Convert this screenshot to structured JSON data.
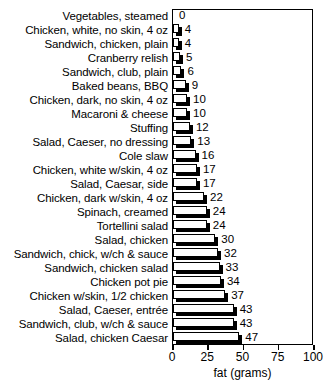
{
  "chart_data": {
    "type": "bar",
    "orientation": "horizontal",
    "title": "",
    "xlabel": "fat (grams)",
    "ylabel": "",
    "xlim": [
      0,
      100
    ],
    "xticks": [
      0,
      25,
      50,
      75,
      100
    ],
    "grid": false,
    "legend": null,
    "value_labels": true,
    "categories": [
      "Vegetables, steamed",
      "Chicken, white, no skin, 4 oz",
      "Sandwich, chicken, plain",
      "Cranberry relish",
      "Sandwich, club, plain",
      "Baked beans, BBQ",
      "Chicken, dark, no skin, 4 oz",
      "Macaroni & cheese",
      "Stuffing",
      "Salad, Caeser, no dressing",
      "Cole slaw",
      "Chicken, white w/skin, 4 oz",
      "Salad, Caesar, side",
      "Chicken, dark w/skin, 4 oz",
      "Spinach, creamed",
      "Tortellini salad",
      "Salad, chicken",
      "Sandwich, chick, w/ch & sauce",
      "Sandwich, chicken salad",
      "Chicken pot pie",
      "Chicken w/skin, 1/2 chicken",
      "Salad, Caeser, entrée",
      "Sandwich, club, w/ch & sauce",
      "Salad, chicken Caesar"
    ],
    "values": [
      0,
      4,
      4,
      5,
      6,
      9,
      10,
      10,
      12,
      13,
      16,
      17,
      17,
      22,
      24,
      24,
      30,
      32,
      33,
      34,
      37,
      43,
      43,
      47
    ],
    "value_text": [
      "0",
      "4",
      "4",
      "5",
      "6",
      "9",
      "10",
      "10",
      "12",
      "13",
      "16",
      "17",
      "17",
      "22",
      "24",
      "24",
      "30",
      "32",
      "33",
      "34",
      "37",
      "43",
      "43",
      "47"
    ],
    "xtick_labels": [
      "0",
      "25",
      "50",
      "75",
      "100"
    ],
    "colors": {
      "bar_face": "#ffffff",
      "bar_edge": "#000000",
      "bar_shadow": "#000000",
      "axis": "#000000",
      "text": "#000000",
      "background": "#ffffff"
    }
  }
}
